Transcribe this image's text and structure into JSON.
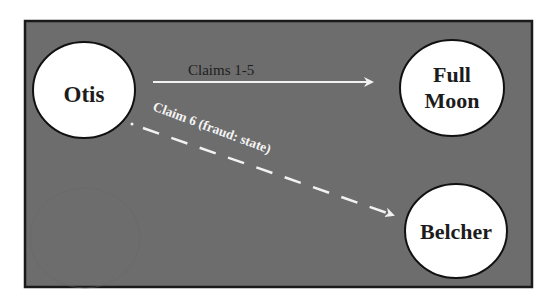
{
  "diagram": {
    "background_color": "#6d6d6d",
    "frame_border_color": "#1a1a1a",
    "node_fill": "#ffffff",
    "node_stroke": "#111111",
    "arrow_color": "#f2f2f2",
    "nodes": [
      {
        "id": "otis",
        "label_lines": [
          "Otis"
        ]
      },
      {
        "id": "full_moon",
        "label_lines": [
          "Full",
          "Moon"
        ]
      },
      {
        "id": "belcher",
        "label_lines": [
          "Belcher"
        ]
      }
    ],
    "edges": [
      {
        "from": "otis",
        "to": "full_moon",
        "label": "Claims 1-5",
        "style": "solid"
      },
      {
        "from": "otis",
        "to": "belcher",
        "label": "Claim 6 (fraud: state)",
        "style": "dashed"
      }
    ]
  }
}
